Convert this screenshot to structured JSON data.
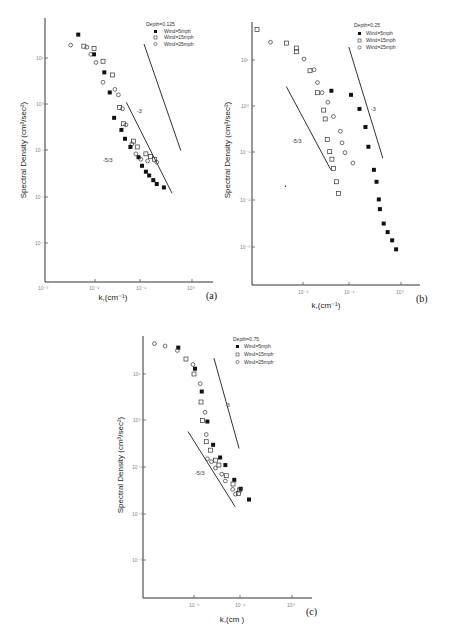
{
  "chart_data": [
    {
      "type": "scatter",
      "panel_label": "(a)",
      "legend_title": "Depth=0.125",
      "xlabel": "k,(cm⁻¹)",
      "ylabel": "Spectral Density (cm³/sec²)",
      "xscale": "log",
      "yscale": "log",
      "xlim": [
        0.001,
        1.5
      ],
      "ylim": [
        0.0002,
        50
      ],
      "xticks": [
        "10⁻³",
        "10⁻²",
        "10⁻¹",
        "10⁰"
      ],
      "yticks": [
        "10¹",
        "10⁰",
        "10⁻¹",
        "10⁻²",
        "10⁻³"
      ],
      "reference_lines": [
        {
          "label": "-3",
          "x": [
            0.11,
            0.62
          ],
          "y": [
            20,
            0.1
          ]
        },
        {
          "label": "-5/3",
          "x": [
            0.048,
            0.41
          ],
          "y": [
            1.1,
            0.012
          ]
        }
      ],
      "series": [
        {
          "name": "Wind=5mph",
          "marker": "filled-square",
          "points": [
            [
              0.005,
              32
            ],
            [
              0.0105,
              12
            ],
            [
              0.017,
              4.9
            ],
            [
              0.022,
              1.8
            ],
            [
              0.027,
              0.51
            ],
            [
              0.038,
              0.28
            ],
            [
              0.045,
              0.18
            ],
            [
              0.058,
              0.12
            ],
            [
              0.085,
              0.072
            ],
            [
              0.1,
              0.047
            ],
            [
              0.12,
              0.035
            ],
            [
              0.14,
              0.029
            ],
            [
              0.17,
              0.023
            ],
            [
              0.2,
              0.019
            ],
            [
              0.28,
              0.016
            ]
          ]
        },
        {
          "name": "Wind=15mph",
          "marker": "open-square",
          "points": [
            [
              0.0065,
              18
            ],
            [
              0.0105,
              16
            ],
            [
              0.016,
              8.5
            ],
            [
              0.025,
              4.3
            ],
            [
              0.035,
              0.85
            ],
            [
              0.042,
              0.38
            ],
            [
              0.067,
              0.16
            ],
            [
              0.08,
              0.12
            ],
            [
              0.12,
              0.085
            ],
            [
              0.15,
              0.075
            ],
            [
              0.18,
              0.065
            ]
          ]
        },
        {
          "name": "Wind=25mph",
          "marker": "open-circle",
          "points": [
            [
              0.0035,
              19
            ],
            [
              0.0075,
              17
            ],
            [
              0.009,
              12
            ],
            [
              0.0115,
              8
            ],
            [
              0.016,
              3
            ],
            [
              0.028,
              2.1
            ],
            [
              0.033,
              1.6
            ],
            [
              0.04,
              0.8
            ],
            [
              0.047,
              0.36
            ],
            [
              0.062,
              0.14
            ],
            [
              0.075,
              0.085
            ],
            [
              0.095,
              0.065
            ],
            [
              0.13,
              0.06
            ],
            [
              0.2,
              0.056
            ]
          ]
        }
      ]
    },
    {
      "type": "scatter",
      "panel_label": "(b)",
      "legend_title": "Depth=0.25",
      "xlabel": "k,(cm⁻¹)",
      "ylabel": "Spectral Density (cm³/sec²)",
      "xscale": "log",
      "yscale": "log",
      "xlim": [
        0.001,
        1.5
      ],
      "ylim": [
        0.0002,
        50
      ],
      "xticks": [
        "10⁻²",
        "10⁻¹",
        "10⁰"
      ],
      "yticks": [
        "10¹",
        "10⁰",
        "10⁻¹",
        "10⁻²",
        "10⁻³"
      ],
      "reference_lines": [
        {
          "label": "-3",
          "x": [
            0.09,
            0.46
          ],
          "y": [
            19,
            0.08
          ]
        },
        {
          "label": "-5/3",
          "x": [
            0.0045,
            0.038
          ],
          "y": [
            2.7,
            0.045
          ]
        }
      ],
      "series": [
        {
          "name": "Wind=5mph",
          "marker": "filled-square",
          "points": [
            [
              0.039,
              2.2
            ],
            [
              0.1,
              1.8
            ],
            [
              0.15,
              0.9
            ],
            [
              0.2,
              0.37
            ],
            [
              0.23,
              0.14
            ],
            [
              0.3,
              0.045
            ],
            [
              0.34,
              0.025
            ],
            [
              0.38,
              0.0105
            ],
            [
              0.4,
              0.0065
            ],
            [
              0.48,
              0.0032
            ],
            [
              0.58,
              0.0021
            ],
            [
              0.72,
              0.0014
            ],
            [
              0.87,
              0.0009
            ]
          ]
        },
        {
          "name": "Wind=15mph",
          "marker": "open-square",
          "points": [
            [
              0.0011,
              45
            ],
            [
              0.0045,
              23
            ],
            [
              0.0073,
              18
            ],
            [
              0.0073,
              15
            ],
            [
              0.014,
              5.9
            ],
            [
              0.02,
              2
            ],
            [
              0.027,
              0.85
            ],
            [
              0.029,
              0.55
            ],
            [
              0.032,
              0.2
            ],
            [
              0.036,
              0.11
            ],
            [
              0.04,
              0.076
            ],
            [
              0.043,
              0.048
            ],
            [
              0.05,
              0.025
            ],
            [
              0.055,
              0.014
            ]
          ]
        },
        {
          "name": "Wind=25mph",
          "marker": "open-circle",
          "points": [
            [
              0.0021,
              24
            ],
            [
              0.0105,
              10.5
            ],
            [
              0.017,
              6.2
            ],
            [
              0.02,
              3.3
            ],
            [
              0.025,
              2
            ],
            [
              0.033,
              1.25
            ],
            [
              0.043,
              0.62
            ],
            [
              0.06,
              0.3
            ],
            [
              0.065,
              0.17
            ],
            [
              0.075,
              0.105
            ],
            [
              0.11,
              0.063
            ]
          ]
        }
      ],
      "stray_mark": {
        "x": 0.0043,
        "y": 0.02
      }
    },
    {
      "type": "scatter",
      "panel_label": "(c)",
      "legend_title": "Depth=0.75",
      "xlabel": "k,(cm )",
      "ylabel": "Spectral Density (cm³/sec²)",
      "xscale": "log",
      "yscale": "log",
      "xlim": [
        0.001,
        1.5
      ],
      "ylim": [
        0.0002,
        50
      ],
      "xticks": [
        "10⁻²",
        "10⁻¹",
        "10⁰"
      ],
      "yticks": [
        "10¹",
        "10⁰",
        "10⁻¹",
        "10⁻²",
        "10⁻³"
      ],
      "reference_lines": [
        {
          "label": "-3",
          "x": [
            0.026,
            0.087
          ],
          "y": [
            22,
            0.25
          ]
        },
        {
          "label": "-5/3",
          "x": [
            0.0075,
            0.072
          ],
          "y": [
            0.58,
            0.014
          ]
        }
      ],
      "series": [
        {
          "name": "Wind=5mph",
          "marker": "filled-square",
          "points": [
            [
              0.0047,
              37
            ],
            [
              0.0105,
              13
            ],
            [
              0.0145,
              4.2
            ],
            [
              0.019,
              0.95
            ],
            [
              0.025,
              0.3
            ],
            [
              0.035,
              0.16
            ],
            [
              0.045,
              0.11
            ],
            [
              0.069,
              0.053
            ],
            [
              0.094,
              0.034
            ],
            [
              0.14,
              0.02
            ]
          ]
        },
        {
          "name": "Wind=15mph",
          "marker": "open-square",
          "points": [
            [
              0.0068,
              21
            ],
            [
              0.01,
              10
            ],
            [
              0.014,
              2.5
            ],
            [
              0.015,
              1
            ],
            [
              0.018,
              0.35
            ],
            [
              0.022,
              0.23
            ],
            [
              0.028,
              0.14
            ],
            [
              0.033,
              0.11
            ],
            [
              0.047,
              0.065
            ],
            [
              0.065,
              0.043
            ],
            [
              0.088,
              0.032
            ],
            [
              0.085,
              0.027
            ]
          ]
        },
        {
          "name": "Wind=25mph",
          "marker": "open-circle",
          "points": [
            [
              0.0015,
              45
            ],
            [
              0.0025,
              40
            ],
            [
              0.0045,
              32
            ],
            [
              0.0095,
              16
            ],
            [
              0.0135,
              6.2
            ],
            [
              0.017,
              1.5
            ],
            [
              0.018,
              0.5
            ],
            [
              0.019,
              0.15
            ],
            [
              0.023,
              0.13
            ],
            [
              0.028,
              0.095
            ],
            [
              0.038,
              0.07
            ],
            [
              0.045,
              0.05
            ],
            [
              0.064,
              0.033
            ],
            [
              0.073,
              0.026
            ]
          ]
        }
      ]
    }
  ],
  "panels": [
    {
      "label": "(a)",
      "legend_title": "Depth=0.125",
      "xlabel": "k,(cm⁻¹)",
      "ylabel": "Spectral Density (cm³/sec²)",
      "xticks": [
        "10⁻³",
        "10⁻²",
        "10⁻¹",
        "10⁰"
      ],
      "yticks": [
        "10¹",
        "10⁰",
        "10⁻¹",
        "10⁻²",
        "10⁻³"
      ],
      "legend": [
        "Wind=5mph",
        "Wind=15mph",
        "Wind=25mph"
      ],
      "slope_labels": [
        "-3",
        "-5/3"
      ]
    },
    {
      "label": "(b)",
      "legend_title": "Depth=0.25",
      "xlabel": "k,(cm⁻¹)",
      "ylabel": "Spectral Density (cm³/sec²)",
      "xticks": [
        "10⁻²",
        "10⁻¹",
        "10⁰"
      ],
      "yticks": [
        "10¹",
        "10⁰",
        "10⁻¹",
        "10⁻²",
        "10⁻³"
      ],
      "legend": [
        "Wind=5mph",
        "Wind=15mph",
        "Wind=25mph"
      ],
      "slope_labels": [
        "-3",
        "-5/3"
      ]
    },
    {
      "label": "(c)",
      "legend_title": "Depth=0.75",
      "xlabel": "k,(cm )",
      "ylabel": "Spectral Density (cm³/sec²)",
      "xticks": [
        "10⁻²",
        "10⁻¹",
        "10⁰"
      ],
      "yticks": [
        "10¹",
        "10⁰",
        "10⁻¹",
        "10⁻²",
        "10⁻³"
      ],
      "legend": [
        "Wind=5mph",
        "Wind=15mph",
        "Wind=25mph"
      ],
      "slope_labels": [
        "-3",
        "-5/3"
      ]
    }
  ]
}
